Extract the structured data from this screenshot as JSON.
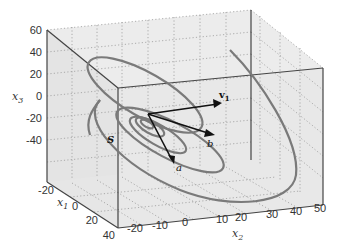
{
  "figure": {
    "type": "3d-trajectory-plot",
    "axes": {
      "x1": {
        "label": "x",
        "sub": "1",
        "ticks": [
          "-20",
          "0",
          "20",
          "40"
        ]
      },
      "x2": {
        "label": "x",
        "sub": "2",
        "ticks": [
          "-20",
          "-10",
          "0",
          "10",
          "20",
          "30",
          "40",
          "50"
        ]
      },
      "x3": {
        "label": "x",
        "sub": "3",
        "ticks": [
          "60",
          "40",
          "20",
          "0",
          "-20",
          "-40"
        ]
      }
    },
    "labels": {
      "S": "S",
      "v1": "v",
      "v1_sub": "1",
      "a": "a",
      "b": "b"
    },
    "colors": {
      "pane": "#e6e6e6",
      "curve": "#7a7a7a",
      "vector": "#111111",
      "grid": "#9a9a9a"
    }
  }
}
